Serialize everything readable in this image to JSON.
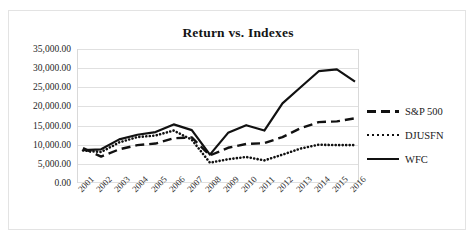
{
  "chart_data": {
    "type": "line",
    "title": "Return vs. Indexes",
    "xlabel": "",
    "ylabel": "",
    "ylim": [
      0,
      35000
    ],
    "grid": true,
    "legend_position": "right",
    "categories": [
      "2001",
      "2002",
      "2003",
      "2004",
      "2005",
      "2006",
      "2007",
      "2008",
      "2009",
      "2010",
      "2011",
      "2012",
      "2013",
      "2014",
      "2015",
      "2016"
    ],
    "ytick_labels": [
      "0.00",
      "5,000.00",
      "10,000.00",
      "15,000.00",
      "20,000.00",
      "25,000.00",
      "30,000.00",
      "35,000.00"
    ],
    "ytick_values": [
      0,
      5000,
      10000,
      15000,
      20000,
      25000,
      30000,
      35000
    ],
    "series": [
      {
        "name": "S&P 500",
        "style": "dashed",
        "color": "#111111",
        "values": [
          9100,
          6900,
          8800,
          9900,
          10300,
          11700,
          11900,
          7200,
          9200,
          10200,
          10400,
          12000,
          14300,
          15900,
          16100,
          16900
        ]
      },
      {
        "name": "DJUSFN",
        "style": "dotted",
        "color": "#111111",
        "values": [
          8500,
          8100,
          10600,
          12000,
          12400,
          13700,
          11300,
          5300,
          6200,
          6800,
          5900,
          7400,
          9000,
          10000,
          9900,
          9900
        ]
      },
      {
        "name": "WFC",
        "style": "solid",
        "color": "#111111",
        "values": [
          8600,
          8800,
          11400,
          12600,
          13300,
          15300,
          13800,
          7400,
          13100,
          15100,
          13700,
          20800,
          25000,
          29200,
          29700,
          26500
        ]
      }
    ]
  },
  "legend": {
    "items": [
      {
        "label": "S&P 500",
        "style": "dashed"
      },
      {
        "label": "DJUSFN",
        "style": "dotted"
      },
      {
        "label": "WFC",
        "style": "solid"
      }
    ]
  }
}
